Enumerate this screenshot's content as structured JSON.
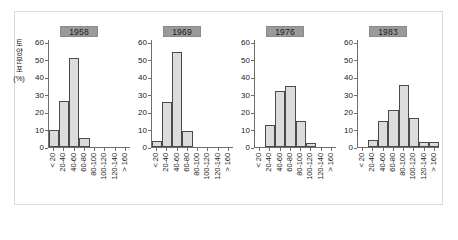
{
  "figure": {
    "background_color": "#ffffff",
    "frame_color": "#d9d9d9",
    "bar_fill_color": "#dcdcdc",
    "bar_border_color": "#4a4a4a",
    "axis_color": "#6f6f6f",
    "strip_background_color": "#9a9a9a"
  },
  "axis": {
    "ylabel_chars": [
      "토",
      "양",
      "분",
      "포"
    ],
    "ylabel_unit": "(%)",
    "yticks": [
      0,
      10,
      20,
      30,
      40,
      50,
      60
    ],
    "ylim": [
      0,
      62
    ],
    "xticklabels": [
      "< 20",
      "20-40",
      "40-60",
      "60-80",
      "80-100",
      "100-120",
      "120-140",
      "> 160"
    ]
  },
  "caption": {
    "text": ""
  },
  "chart_data": {
    "type": "bar",
    "title": "",
    "subtitle": "",
    "xlabel": "",
    "ylabel": "토양분포 (%)",
    "ylim": [
      0,
      62
    ],
    "grid": false,
    "legend": "none",
    "layout": "trellis-4-panels-horizontal",
    "categories": [
      "< 20",
      "20-40",
      "40-60",
      "60-80",
      "80-100",
      "100-120",
      "120-140",
      "> 160"
    ],
    "panels": [
      {
        "label": "1958",
        "values": [
          10,
          26.5,
          51,
          5,
          0,
          0,
          0,
          0
        ]
      },
      {
        "label": "1969",
        "values": [
          3.5,
          26,
          54.5,
          9,
          0,
          0,
          0,
          0
        ]
      },
      {
        "label": "1976",
        "values": [
          0,
          12.5,
          32,
          35,
          15,
          2.5,
          0,
          0
        ]
      },
      {
        "label": "1983",
        "values": [
          0,
          4,
          15,
          21,
          35.5,
          16.5,
          3,
          3
        ]
      }
    ]
  }
}
